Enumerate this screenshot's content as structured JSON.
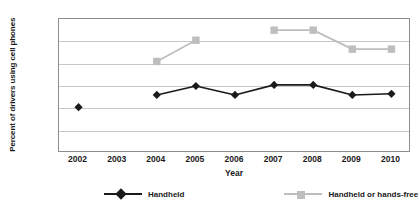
{
  "chart_data": {
    "type": "line",
    "title": "",
    "xlabel": "Year",
    "ylabel": "Percent of drivers using cell phones",
    "categories": [
      "2002",
      "2003",
      "2004",
      "2005",
      "2006",
      "2007",
      "2008",
      "2009",
      "2010"
    ],
    "ylim": [
      0,
      12
    ],
    "ytick_labels": [
      "0%",
      "2%",
      "4%",
      "6%",
      "8%",
      "10%",
      "12%"
    ],
    "ytick_values": [
      0,
      2,
      4,
      6,
      8,
      10,
      12
    ],
    "grid": true,
    "legend_position": "bottom",
    "series": [
      {
        "name": "Handheld",
        "color": "#1a1a1a",
        "marker": "diamond",
        "values": [
          4.1,
          null,
          5.2,
          6.0,
          5.2,
          6.1,
          6.1,
          5.2,
          5.3
        ]
      },
      {
        "name": "Handheld or hands-free",
        "color": "#bebebe",
        "marker": "square",
        "values": [
          null,
          null,
          8.2,
          10.1,
          null,
          11.0,
          11.0,
          9.3,
          9.3
        ]
      }
    ]
  },
  "axis": {
    "y_title": "Percent of drivers using cell phones",
    "x_title": "Year"
  },
  "legend": {
    "items": [
      {
        "label": "Handheld",
        "color": "#1a1a1a",
        "marker": "diamond"
      },
      {
        "label": "Handheld or hands-free",
        "color": "#bebebe",
        "marker": "square"
      }
    ]
  },
  "colors": {
    "handheld": "#1a1a1a",
    "handheld_or_handsfree": "#bebebe",
    "gridline": "#c8c8c8",
    "axis": "#8d8d8d",
    "background": "#ffffff"
  }
}
